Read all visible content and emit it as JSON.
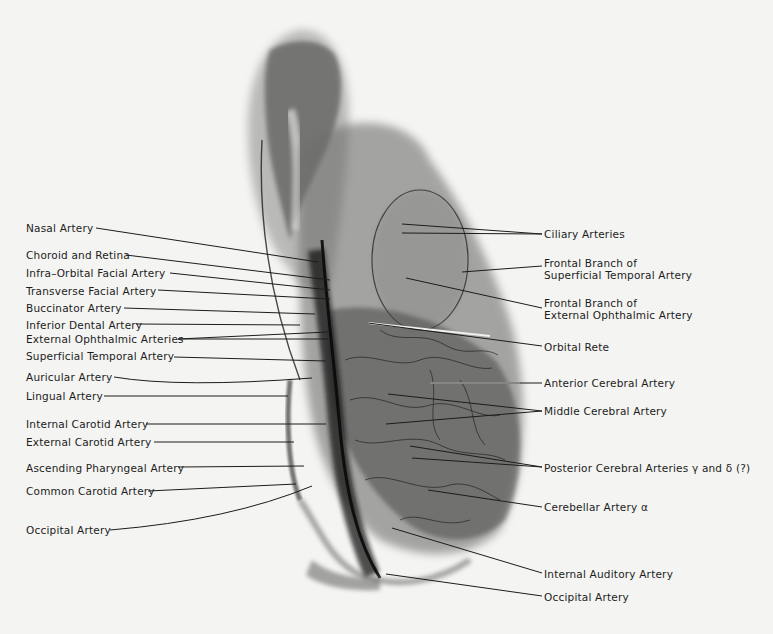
{
  "figure": {
    "type": "labeled radiograph (arteriogram), lateral view of head",
    "background_color": "#f4f4f2",
    "ink_color": "#1c1c1c"
  },
  "left_labels": [
    {
      "id": "nasal-artery",
      "text": "Nasal Artery",
      "x": 26,
      "y": 222,
      "line": [
        [
          96,
          228
        ],
        [
          318,
          262
        ]
      ]
    },
    {
      "id": "choroid-retina",
      "text": "Choroid and Retina",
      "x": 26,
      "y": 249,
      "line": [
        [
          126,
          255
        ],
        [
          330,
          280
        ]
      ]
    },
    {
      "id": "infra-orbital-facial",
      "text": "Infra–Orbital Facial Artery",
      "x": 26,
      "y": 267,
      "line": [
        [
          170,
          273
        ],
        [
          330,
          290
        ]
      ]
    },
    {
      "id": "transverse-facial",
      "text": "Transverse Facial Artery",
      "x": 26,
      "y": 285,
      "line": [
        [
          158,
          290
        ],
        [
          330,
          299
        ]
      ]
    },
    {
      "id": "buccinator",
      "text": "Buccinator Artery",
      "x": 26,
      "y": 302,
      "line": [
        [
          124,
          308
        ],
        [
          315,
          314
        ]
      ]
    },
    {
      "id": "inferior-dental",
      "text": "Inferior Dental Artery",
      "x": 26,
      "y": 319,
      "line": [
        [
          136,
          324
        ],
        [
          300,
          325
        ]
      ]
    },
    {
      "id": "external-ophthalmic",
      "text": "External Ophthalmic Arteries",
      "x": 26,
      "y": 333,
      "line": [
        [
          178,
          339
        ],
        [
          328,
          332
        ]
      ],
      "line2": [
        [
          178,
          339
        ],
        [
          328,
          339
        ]
      ]
    },
    {
      "id": "superficial-temporal",
      "text": "Superficial Temporal Artery",
      "x": 26,
      "y": 350,
      "line": [
        [
          174,
          357
        ],
        [
          326,
          361
        ]
      ]
    },
    {
      "id": "auricular",
      "text": "Auricular Artery",
      "x": 26,
      "y": 371,
      "line": [
        [
          114,
          377
        ],
        [
          180,
          388
        ],
        [
          312,
          378
        ]
      ],
      "curve": true
    },
    {
      "id": "lingual",
      "text": "Lingual Artery",
      "x": 26,
      "y": 390,
      "line": [
        [
          104,
          396
        ],
        [
          288,
          396
        ]
      ]
    },
    {
      "id": "internal-carotid",
      "text": "Internal Carotid Artery",
      "x": 26,
      "y": 418,
      "line": [
        [
          146,
          424
        ],
        [
          326,
          424
        ]
      ]
    },
    {
      "id": "external-carotid",
      "text": "External Carotid Artery",
      "x": 26,
      "y": 436,
      "line": [
        [
          154,
          442
        ],
        [
          294,
          442
        ]
      ]
    },
    {
      "id": "ascending-pharyngeal",
      "text": "Ascending Pharyngeal Artery",
      "x": 26,
      "y": 462,
      "line": [
        [
          178,
          467
        ],
        [
          304,
          466
        ]
      ]
    },
    {
      "id": "common-carotid",
      "text": "Common Carotid Artery",
      "x": 26,
      "y": 485,
      "line": [
        [
          148,
          491
        ],
        [
          296,
          484
        ]
      ]
    },
    {
      "id": "occipital-left",
      "text": "Occipital Artery",
      "x": 26,
      "y": 524,
      "line": [
        [
          110,
          530
        ],
        [
          230,
          520
        ],
        [
          312,
          486
        ]
      ],
      "curve": true
    }
  ],
  "right_labels": [
    {
      "id": "ciliary-arteries",
      "text": [
        "Ciliary Arteries"
      ],
      "x": 544,
      "y": 228,
      "line": [
        [
          542,
          234
        ],
        [
          402,
          224
        ]
      ],
      "line2": [
        [
          542,
          234
        ],
        [
          402,
          233
        ]
      ]
    },
    {
      "id": "frontal-branch-superficial-temporal",
      "text": [
        "Frontal Branch of",
        "Superficial Temporal Artery"
      ],
      "x": 544,
      "y": 257,
      "line": [
        [
          542,
          266
        ],
        [
          462,
          272
        ]
      ]
    },
    {
      "id": "frontal-branch-external-ophthalmic",
      "text": [
        "Frontal Branch of",
        "External Ophthalmic Artery"
      ],
      "x": 544,
      "y": 297,
      "line": [
        [
          542,
          308
        ],
        [
          406,
          278
        ]
      ]
    },
    {
      "id": "orbital-rete",
      "text": [
        "Orbital Rete"
      ],
      "x": 544,
      "y": 341,
      "line": [
        [
          542,
          346
        ],
        [
          368,
          323
        ]
      ],
      "white_segment": [
        [
          368,
          323
        ],
        [
          490,
          336
        ]
      ]
    },
    {
      "id": "anterior-cerebral",
      "text": [
        "Anterior Cerebral Artery"
      ],
      "x": 544,
      "y": 377,
      "line": [
        [
          542,
          383
        ],
        [
          430,
          383
        ]
      ],
      "white_segment": [
        [
          430,
          383
        ],
        [
          520,
          383
        ]
      ]
    },
    {
      "id": "middle-cerebral",
      "text": [
        "Middle Cerebral Artery"
      ],
      "x": 544,
      "y": 405,
      "line": [
        [
          542,
          411
        ],
        [
          388,
          394
        ]
      ],
      "line2": [
        [
          542,
          411
        ],
        [
          386,
          424
        ]
      ]
    },
    {
      "id": "posterior-cerebral",
      "text": [
        "Posterior Cerebral Arteries γ and δ (?)"
      ],
      "x": 544,
      "y": 462,
      "line": [
        [
          542,
          467
        ],
        [
          410,
          446
        ]
      ],
      "line2": [
        [
          542,
          467
        ],
        [
          412,
          458
        ]
      ]
    },
    {
      "id": "cerebellar-artery",
      "text": [
        "Cerebellar Artery α"
      ],
      "x": 544,
      "y": 501,
      "line": [
        [
          542,
          507
        ],
        [
          428,
          490
        ]
      ]
    },
    {
      "id": "internal-auditory",
      "text": [
        "Internal Auditory Artery"
      ],
      "x": 544,
      "y": 568,
      "line": [
        [
          542,
          573
        ],
        [
          392,
          528
        ]
      ]
    },
    {
      "id": "occipital-right",
      "text": [
        "Occipital Artery"
      ],
      "x": 544,
      "y": 591,
      "line": [
        [
          542,
          596
        ],
        [
          386,
          574
        ]
      ]
    }
  ]
}
